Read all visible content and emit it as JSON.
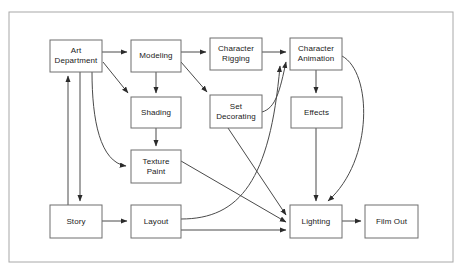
{
  "diagram": {
    "type": "flowchart",
    "colors": {
      "node_stroke": "#6e6e6e",
      "node_fill": "#ffffff",
      "edge_stroke": "#4a4a4a",
      "frame_stroke": "#a8a8a8",
      "background": "#ffffff",
      "text": "#1a1a1a"
    },
    "frame": {
      "x": 9,
      "y": 12,
      "width": 444,
      "height": 250
    },
    "nodes": [
      {
        "id": "art-department",
        "label": "Art\nDepartment",
        "x": 50,
        "y": 40,
        "width": 52,
        "height": 32
      },
      {
        "id": "modeling",
        "label": "Modeling",
        "x": 131,
        "y": 40,
        "width": 50,
        "height": 32
      },
      {
        "id": "character-rigging",
        "label": "Character\nRigging",
        "x": 210,
        "y": 38,
        "width": 52,
        "height": 32
      },
      {
        "id": "character-animation",
        "label": "Character\nAnimation",
        "x": 290,
        "y": 38,
        "width": 52,
        "height": 32
      },
      {
        "id": "shading",
        "label": "Shading",
        "x": 131,
        "y": 97,
        "width": 50,
        "height": 31
      },
      {
        "id": "set-decorating",
        "label": "Set\nDecorating",
        "x": 210,
        "y": 95,
        "width": 52,
        "height": 33
      },
      {
        "id": "effects",
        "label": "Effects",
        "x": 291,
        "y": 97,
        "width": 51,
        "height": 31
      },
      {
        "id": "texture-paint",
        "label": "Texture\nPaint",
        "x": 131,
        "y": 150,
        "width": 50,
        "height": 33
      },
      {
        "id": "story",
        "label": "Story",
        "x": 50,
        "y": 205,
        "width": 52,
        "height": 33
      },
      {
        "id": "layout",
        "label": "Layout",
        "x": 131,
        "y": 205,
        "width": 50,
        "height": 33
      },
      {
        "id": "lighting",
        "label": "Lighting",
        "x": 290,
        "y": 205,
        "width": 52,
        "height": 33
      },
      {
        "id": "film-out",
        "label": "Film Out",
        "x": 365,
        "y": 205,
        "width": 53,
        "height": 33
      }
    ],
    "edges": [
      {
        "id": "art-to-modeling",
        "from": "art-department",
        "to": "modeling",
        "path": "M 102 52 L 127 52"
      },
      {
        "id": "art-to-set-decorating",
        "from": "art-department",
        "to": "set-decorating",
        "path": "M 103 62 L 128 93"
      },
      {
        "id": "art-to-texture-paint",
        "from": "art-department",
        "to": "texture-paint",
        "path": "M 92 72 C 92 120, 100 162, 126 166"
      },
      {
        "id": "art-to-story",
        "from": "art-department",
        "to": "story",
        "path": "M 80 72 L 80 201"
      },
      {
        "id": "story-to-art",
        "from": "story",
        "to": "art-department",
        "path": "M 68 205 L 68 76"
      },
      {
        "id": "story-to-layout",
        "from": "story",
        "to": "layout",
        "path": "M 102 221 L 127 221"
      },
      {
        "id": "modeling-to-rigging",
        "from": "modeling",
        "to": "character-rigging",
        "path": "M 181 52 L 206 52"
      },
      {
        "id": "modeling-to-shading",
        "from": "modeling",
        "to": "shading",
        "path": "M 156 72 L 156 93"
      },
      {
        "id": "modeling-to-set-decorating",
        "from": "modeling",
        "to": "set-decorating",
        "path": "M 181 62 L 207 92"
      },
      {
        "id": "shading-to-texture-paint",
        "from": "shading",
        "to": "texture-paint",
        "path": "M 156 128 L 156 146"
      },
      {
        "id": "rigging-to-animation",
        "from": "character-rigging",
        "to": "character-animation",
        "path": "M 262 52 L 286 52"
      },
      {
        "id": "animation-to-effects",
        "from": "character-animation",
        "to": "effects",
        "path": "M 316 70 L 316 93"
      },
      {
        "id": "animation-to-lighting",
        "from": "character-animation",
        "to": "lighting",
        "path": "M 342 56 C 372 72, 374 160, 328 201"
      },
      {
        "id": "effects-to-lighting",
        "from": "effects",
        "to": "lighting",
        "path": "M 316 128 L 316 201"
      },
      {
        "id": "set-decorating-to-lighting",
        "from": "set-decorating",
        "to": "lighting",
        "path": "M 228 128 L 286 215"
      },
      {
        "id": "texture-paint-to-lighting",
        "from": "texture-paint",
        "to": "lighting",
        "path": "M 181 161 L 286 222"
      },
      {
        "id": "layout-to-lighting",
        "from": "layout",
        "to": "lighting",
        "path": "M 181 230 L 286 230"
      },
      {
        "id": "layout-to-animation",
        "from": "layout",
        "to": "character-animation",
        "path": "M 181 219 C 240 219, 270 180, 280 66"
      },
      {
        "id": "set-decorating-to-animation",
        "from": "set-decorating",
        "to": "character-animation",
        "path": "M 262 112 C 276 108, 280 90, 286 62"
      },
      {
        "id": "lighting-to-film-out",
        "from": "lighting",
        "to": "film-out",
        "path": "M 342 221 L 361 221"
      }
    ]
  }
}
